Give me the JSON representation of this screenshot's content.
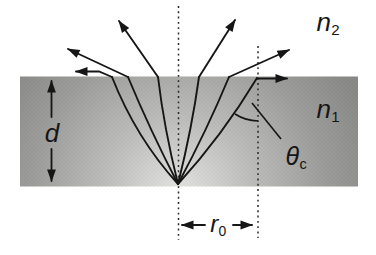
{
  "figure": {
    "labels": {
      "medium_above": {
        "base": "n",
        "sub": "2"
      },
      "medium_slab": {
        "base": "n",
        "sub": "1"
      },
      "critical_angle": {
        "base": "θ",
        "sub": "c"
      },
      "escape_radius": {
        "base": "r",
        "sub": "0"
      },
      "slab_thickness": {
        "base": "d"
      }
    },
    "colors": {
      "background": "#ffffff",
      "ink": "#161616",
      "slab_center": "#e6e6e4",
      "slab_mid": "#b4b4b2",
      "slab_edge": "#8a8a88"
    }
  }
}
